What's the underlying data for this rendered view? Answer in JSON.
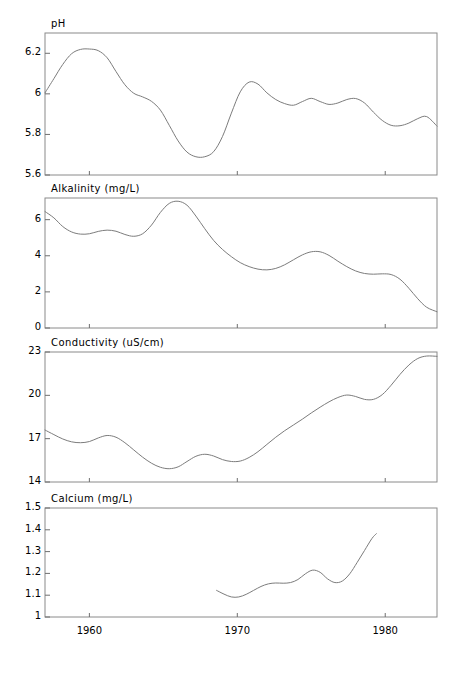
{
  "figure": {
    "width": 456,
    "height": 674,
    "background": "#ffffff",
    "line_color": "#7c7c7c",
    "frame_color": "#8a8a8a"
  },
  "xaxis": {
    "ticks": [
      1960,
      1970,
      1980
    ],
    "tick_labels": [
      "1960",
      "1970",
      "1980"
    ],
    "range": [
      1957.0,
      1983.5
    ]
  },
  "chart_data": [
    {
      "type": "line",
      "title": "pH",
      "xlabel": "",
      "ylabel": "pH",
      "ylim": [
        5.6,
        6.3
      ],
      "yticks": [
        5.6,
        5.8,
        6.0,
        6.2
      ],
      "ytick_labels": [
        "5.6",
        "5.8",
        "6",
        "6.2"
      ],
      "grid": false,
      "legend": "none",
      "x": [
        1957.0,
        1957.6,
        1958.2,
        1958.8,
        1959.4,
        1960.0,
        1960.6,
        1961.2,
        1961.8,
        1962.4,
        1963.0,
        1963.6,
        1964.2,
        1964.8,
        1965.4,
        1966.0,
        1966.6,
        1967.2,
        1967.8,
        1968.4,
        1969.0,
        1969.6,
        1970.2,
        1970.8,
        1971.4,
        1972.0,
        1972.6,
        1973.2,
        1973.8,
        1974.4,
        1975.0,
        1975.6,
        1976.2,
        1976.8,
        1977.4,
        1978.0,
        1978.6,
        1979.2,
        1979.8,
        1980.4,
        1981.0,
        1981.6,
        1982.2,
        1982.8,
        1983.5
      ],
      "values": [
        6.005,
        6.075,
        6.145,
        6.198,
        6.219,
        6.221,
        6.213,
        6.178,
        6.11,
        6.045,
        6.003,
        5.985,
        5.963,
        5.92,
        5.845,
        5.768,
        5.713,
        5.69,
        5.69,
        5.715,
        5.79,
        5.905,
        6.01,
        6.058,
        6.048,
        6.005,
        5.972,
        5.952,
        5.944,
        5.962,
        5.978,
        5.962,
        5.948,
        5.955,
        5.972,
        5.977,
        5.955,
        5.91,
        5.869,
        5.845,
        5.843,
        5.856,
        5.878,
        5.888,
        5.841
      ]
    },
    {
      "type": "line",
      "title": "Alkalinity (mg/L)",
      "xlabel": "",
      "ylabel": "Alkalinity (mg/L)",
      "ylim": [
        0,
        7.2
      ],
      "yticks": [
        0,
        2,
        4,
        6
      ],
      "ytick_labels": [
        "0",
        "2",
        "4",
        "6"
      ],
      "grid": false,
      "legend": "none",
      "x": [
        1957.0,
        1957.6,
        1958.2,
        1958.8,
        1959.4,
        1960.0,
        1960.6,
        1961.2,
        1961.8,
        1962.4,
        1963.0,
        1963.6,
        1964.2,
        1964.8,
        1965.4,
        1966.0,
        1966.6,
        1967.2,
        1967.8,
        1968.4,
        1969.0,
        1969.6,
        1970.2,
        1970.8,
        1971.4,
        1972.0,
        1972.6,
        1973.2,
        1973.8,
        1974.4,
        1975.0,
        1975.6,
        1976.2,
        1976.8,
        1977.4,
        1978.0,
        1978.6,
        1979.2,
        1979.8,
        1980.4,
        1981.0,
        1981.6,
        1982.2,
        1982.8,
        1983.5
      ],
      "values": [
        6.45,
        6.1,
        5.62,
        5.32,
        5.2,
        5.22,
        5.35,
        5.42,
        5.36,
        5.18,
        5.08,
        5.22,
        5.7,
        6.4,
        6.9,
        7.02,
        6.8,
        6.2,
        5.5,
        4.85,
        4.35,
        3.95,
        3.62,
        3.4,
        3.26,
        3.22,
        3.3,
        3.5,
        3.78,
        4.05,
        4.22,
        4.22,
        4.02,
        3.7,
        3.4,
        3.16,
        3.02,
        2.98,
        3.0,
        2.96,
        2.7,
        2.2,
        1.62,
        1.15,
        0.9
      ]
    },
    {
      "type": "line",
      "title": "Conductivity (uS/cm)",
      "xlabel": "",
      "ylabel": "Conductivity (uS/cm)",
      "ylim": [
        14,
        23
      ],
      "yticks": [
        14,
        17,
        20,
        23
      ],
      "ytick_labels": [
        "14",
        "17",
        "20",
        "23"
      ],
      "grid": false,
      "legend": "none",
      "x": [
        1957.0,
        1957.6,
        1958.2,
        1958.8,
        1959.4,
        1960.0,
        1960.6,
        1961.2,
        1961.8,
        1962.4,
        1963.0,
        1963.6,
        1964.2,
        1964.8,
        1965.4,
        1966.0,
        1966.6,
        1967.2,
        1967.8,
        1968.4,
        1969.0,
        1969.6,
        1970.2,
        1970.8,
        1971.4,
        1972.0,
        1972.6,
        1973.2,
        1973.8,
        1974.4,
        1975.0,
        1975.6,
        1976.2,
        1976.8,
        1977.4,
        1978.0,
        1978.6,
        1979.2,
        1979.8,
        1980.4,
        1981.0,
        1981.6,
        1982.2,
        1982.8,
        1983.5
      ],
      "values": [
        17.6,
        17.28,
        16.98,
        16.78,
        16.72,
        16.8,
        17.05,
        17.22,
        17.1,
        16.72,
        16.22,
        15.72,
        15.3,
        15.02,
        14.92,
        15.05,
        15.42,
        15.78,
        15.92,
        15.8,
        15.55,
        15.42,
        15.45,
        15.7,
        16.1,
        16.6,
        17.1,
        17.55,
        17.95,
        18.35,
        18.78,
        19.18,
        19.55,
        19.85,
        20.02,
        19.92,
        19.72,
        19.72,
        20.05,
        20.7,
        21.45,
        22.1,
        22.55,
        22.72,
        22.7
      ]
    },
    {
      "type": "line",
      "title": "Calcium (mg/L)",
      "xlabel": "",
      "ylabel": "Calcium (mg/L)",
      "ylim": [
        1.0,
        1.5
      ],
      "yticks": [
        1.0,
        1.1,
        1.2,
        1.3,
        1.4,
        1.5
      ],
      "ytick_labels": [
        "1",
        "1.1",
        "1.2",
        "1.3",
        "1.4",
        "1.5"
      ],
      "grid": false,
      "legend": "none",
      "x": [
        1968.6,
        1969.1,
        1969.6,
        1970.1,
        1970.6,
        1971.1,
        1971.6,
        1972.1,
        1972.6,
        1973.1,
        1973.6,
        1974.1,
        1974.6,
        1975.1,
        1975.6,
        1976.1,
        1976.6,
        1977.1,
        1977.6,
        1978.1,
        1978.6,
        1979.1,
        1979.4
      ],
      "values": [
        1.122,
        1.105,
        1.092,
        1.092,
        1.104,
        1.122,
        1.14,
        1.152,
        1.156,
        1.155,
        1.158,
        1.172,
        1.198,
        1.215,
        1.205,
        1.175,
        1.158,
        1.165,
        1.198,
        1.25,
        1.305,
        1.36,
        1.382
      ]
    }
  ]
}
